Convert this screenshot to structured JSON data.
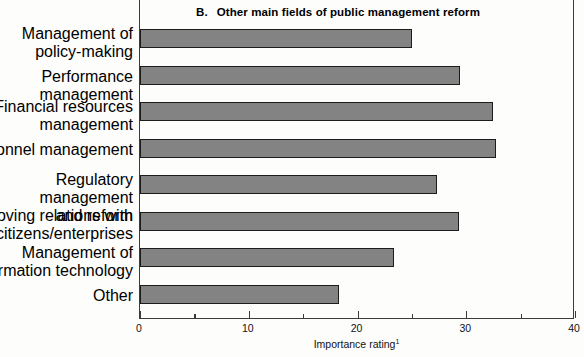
{
  "chart_data": {
    "type": "bar",
    "orientation": "horizontal",
    "title_letter": "B.",
    "title": "Other main fields of public management reform",
    "title_full": "B.   Other main fields of public management reform",
    "categories": [
      "Management of\npolicy-making",
      "Performance management",
      "Financial resources\nmanagement",
      "Personnel management",
      "Regulatory management\nand reform",
      "Improving relations with\ncitizens/enterprises",
      "Management of\ninformation technology",
      "Other"
    ],
    "values": [
      25.0,
      29.4,
      32.5,
      32.7,
      27.3,
      29.3,
      23.4,
      18.3
    ],
    "xlabel": "Importance rating",
    "xlabel_superscript": "1",
    "ylabel": "",
    "xlim": [
      0,
      40
    ],
    "xticks": [
      0,
      10,
      20,
      30,
      40
    ],
    "xtick_labels": [
      "0",
      "10",
      "20",
      "30",
      "40"
    ],
    "xminor_ticks": [
      5,
      15,
      25,
      35
    ],
    "grid": false,
    "legend": null,
    "bar_fill_color": "#838383",
    "bar_edge_color": "#1c1c1c",
    "axis_color": "#3b3b3b",
    "background_color": "#fdfdfc"
  }
}
